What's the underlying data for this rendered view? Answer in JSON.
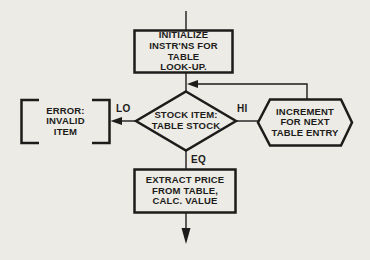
{
  "figure": {
    "type": "flowchart",
    "background_color": "#ecebe6",
    "ink_color": "#1d1c1a"
  },
  "nodes": {
    "initialize": {
      "shape": "process-rectangle",
      "label": "INITIALIZE\nINSTR'NS FOR\nTABLE\nLOOK-UP."
    },
    "stock_item": {
      "shape": "decision-diamond",
      "label": "STOCK ITEM:\nTABLE STOCK"
    },
    "error": {
      "shape": "bracket-annotation-box",
      "label": "ERROR:\nINVALID\nITEM"
    },
    "increment": {
      "shape": "hexagon",
      "label": "INCREMENT\nFOR NEXT\nTABLE ENTRY"
    },
    "extract": {
      "shape": "process-rectangle",
      "label": "EXTRACT PRICE\nFROM TABLE,\nCALC. VALUE"
    }
  },
  "branch_labels": {
    "lo": "LO",
    "hi": "HI",
    "eq": "EQ"
  }
}
